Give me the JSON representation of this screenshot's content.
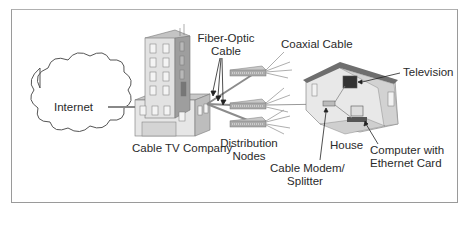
{
  "diagram": {
    "labels": {
      "internet": "Internet",
      "cable_tv_company": "Cable TV Company",
      "fiber_optic_cable_line1": "Fiber-Optic",
      "fiber_optic_cable_line2": "Cable",
      "coaxial_cable": "Coaxial Cable",
      "distribution_nodes_line1": "Distribution",
      "distribution_nodes_line2": "Nodes",
      "television": "Television",
      "house": "House",
      "cable_modem_line1": "Cable Modem/",
      "cable_modem_line2": "Splitter",
      "computer_line1": "Computer with",
      "computer_line2": "Ethernet Card"
    },
    "colors": {
      "line": "#8a8a8a",
      "building_light": "#dcdcdc",
      "building_dark": "#a8a8a8",
      "roof": "#6e6e6e",
      "text": "#2a2a2a"
    }
  }
}
